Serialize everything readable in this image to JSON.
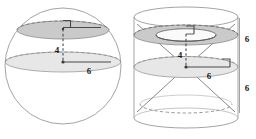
{
  "diagram": {
    "background_color": "#ffffff",
    "stroke_color": "#8a8a8a",
    "dark_stroke_color": "#555555",
    "label_color": "#1a1a1a",
    "fill_light": "#e9e9e9",
    "fill_mid": "#d9d9d9",
    "fill_dark": "#c9c9c9",
    "figures": [
      {
        "name": "sphere-figure",
        "shape": "sphere",
        "center": {
          "x": 63,
          "y": 66
        },
        "radius": 58,
        "cross_sections": [
          {
            "name": "upper-disc",
            "type": "ellipse",
            "cx": 63,
            "cy": 30,
            "rx": 46,
            "ry": 9,
            "fill": "#c9c9c9"
          },
          {
            "name": "equator-disc",
            "type": "ellipse",
            "cx": 63,
            "cy": 62,
            "rx": 57,
            "ry": 10,
            "fill": "#e3e3e3"
          }
        ],
        "segments": [
          {
            "name": "height-segment",
            "label": "4",
            "from": {
              "x": 63,
              "y": 30
            },
            "to": {
              "x": 63,
              "y": 62
            },
            "style": "dashed",
            "label_pos": {
              "x": 57,
              "y": 49
            }
          },
          {
            "name": "radius-segment",
            "label": "6",
            "from": {
              "x": 63,
              "y": 62
            },
            "to": {
              "x": 110,
              "y": 62
            },
            "style": "solid",
            "label_pos": {
              "x": 89,
              "y": 73
            }
          },
          {
            "name": "upper-radius-segment",
            "label": "",
            "from": {
              "x": 63,
              "y": 27
            },
            "to": {
              "x": 100,
              "y": 27
            },
            "style": "solid",
            "label_pos": {
              "x": 0,
              "y": 0
            }
          }
        ],
        "right_angle_markers": [
          {
            "name": "upper-right-angle",
            "x": 63,
            "y": 22,
            "size": 7
          }
        ]
      },
      {
        "name": "cylinder-cone-figure",
        "shape": "cylinder-with-double-cone",
        "cylinder": {
          "cx": 186,
          "top_y": 16,
          "bottom_y": 118,
          "rx": 52,
          "ry": 10
        },
        "cross_sections": [
          {
            "name": "annulus-cross-section",
            "type": "annulus",
            "cx": 186,
            "cy": 35,
            "rx_outer": 52,
            "ry_outer": 10,
            "rx_inner": 30,
            "ry_inner": 6,
            "fill": "#c9c9c9"
          },
          {
            "name": "mid-disc",
            "type": "ellipse",
            "cx": 186,
            "cy": 67,
            "rx": 52,
            "ry": 10,
            "fill": "#e3e3e3"
          }
        ],
        "segments": [
          {
            "name": "height-segment",
            "label": "4",
            "from": {
              "x": 186,
              "y": 35
            },
            "to": {
              "x": 186,
              "y": 67
            },
            "style": "dashed",
            "label_pos": {
              "x": 180,
              "y": 54
            }
          },
          {
            "name": "radius-segment",
            "label": "6",
            "from": {
              "x": 186,
              "y": 67
            },
            "to": {
              "x": 228,
              "y": 67
            },
            "style": "solid",
            "label_pos": {
              "x": 208,
              "y": 78
            }
          },
          {
            "name": "cone-left-upper",
            "from": {
              "x": 186,
              "y": 67
            },
            "to": {
              "x": 136,
              "y": 25
            },
            "style": "solid"
          },
          {
            "name": "cone-right-upper",
            "from": {
              "x": 186,
              "y": 67
            },
            "to": {
              "x": 236,
              "y": 25
            },
            "style": "solid"
          },
          {
            "name": "cone-left-lower",
            "from": {
              "x": 186,
              "y": 67
            },
            "to": {
              "x": 136,
              "y": 110
            },
            "style": "solid"
          },
          {
            "name": "cone-right-lower",
            "from": {
              "x": 186,
              "y": 67
            },
            "to": {
              "x": 236,
              "y": 110
            },
            "style": "solid"
          }
        ],
        "right_angle_markers": [
          {
            "name": "upper-right-angle",
            "x": 186,
            "y": 28,
            "size": 7
          },
          {
            "name": "mid-right-angle",
            "x": 215,
            "y": 60,
            "size": 7
          }
        ],
        "dimension_labels": [
          {
            "name": "upper-height-label",
            "label": "6",
            "x": 245,
            "y": 39
          },
          {
            "name": "lower-height-label",
            "label": "6",
            "x": 245,
            "y": 88
          }
        ],
        "dimension_lines": [
          {
            "name": "right-vertical-extent",
            "from": {
              "x": 238,
              "y": 18
            },
            "to": {
              "x": 238,
              "y": 112
            },
            "style": "solid"
          }
        ]
      }
    ],
    "labels": {
      "sphere_height": "4",
      "sphere_radius": "6",
      "cylinder_height": "4",
      "cylinder_radius": "6",
      "cylinder_upper_side": "6",
      "cylinder_lower_side": "6"
    }
  }
}
